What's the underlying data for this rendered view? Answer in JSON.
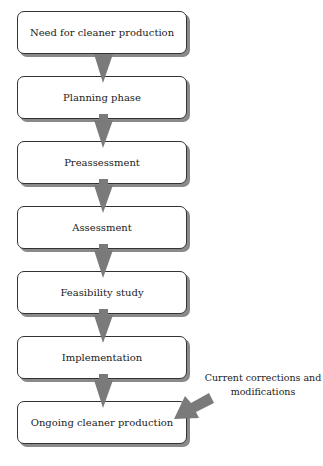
{
  "diagram": {
    "steps": [
      {
        "label": "Need for cleaner production"
      },
      {
        "label": "Planning phase"
      },
      {
        "label": "Preassessment"
      },
      {
        "label": "Assessment"
      },
      {
        "label": "Feasibility study"
      },
      {
        "label": "Implementation"
      },
      {
        "label": "Ongoing cleaner production"
      }
    ],
    "side_input": {
      "line1": "Current corrections and",
      "line2": "modifications"
    },
    "colors": {
      "arrow": "#7a7a7a",
      "box_border": "#333333",
      "box_shadow": "#8a8a8a"
    }
  }
}
